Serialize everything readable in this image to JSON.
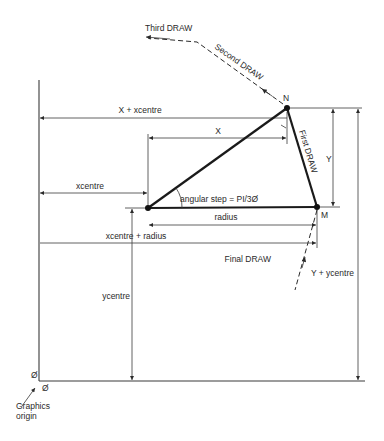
{
  "diagram": {
    "points": {
      "centre": {
        "x": 148,
        "y": 208
      },
      "M": {
        "label": "M",
        "x": 317,
        "y": 207
      },
      "N": {
        "label": "N",
        "x": 287,
        "y": 108
      }
    },
    "draw_labels": {
      "first": "First DRAW",
      "second": "Second DRAW",
      "third": "Third DRAW",
      "final": "Final DRAW"
    },
    "dimensions": {
      "x_plus_xcentre": "X + xcentre",
      "x": "X",
      "xcentre": "xcentre",
      "radius": "radius",
      "xcentre_plus_radius": "xcentre + radius",
      "y": "Y",
      "ycentre": "ycentre",
      "y_plus_ycentre": "Y + ycentre"
    },
    "angle_label": "angular step = PI/3Ø",
    "origin": {
      "x_zero": "Ø",
      "y_zero": "Ø",
      "label_line1": "Graphics",
      "label_line2": "origin"
    }
  }
}
